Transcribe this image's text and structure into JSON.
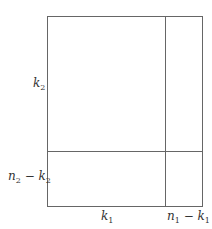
{
  "diagram": {
    "type": "partitioned-rectangle",
    "stroke_color": "#666666",
    "outer_rect": {
      "x1": 47,
      "y1": 16,
      "x2": 202,
      "y2": 206
    },
    "vertical_divider_x": 165,
    "horizontal_divider_y": 151,
    "labels": {
      "left_top": {
        "var": "k",
        "sub": "2"
      },
      "left_bottom": {
        "var1": "n",
        "sub1": "2",
        "op": " − ",
        "var2": "k",
        "sub2": "2"
      },
      "bottom_left": {
        "var": "k",
        "sub": "1"
      },
      "bottom_right": {
        "var1": "n",
        "sub1": "1",
        "op": " − ",
        "var2": "k",
        "sub2": "1"
      }
    }
  }
}
